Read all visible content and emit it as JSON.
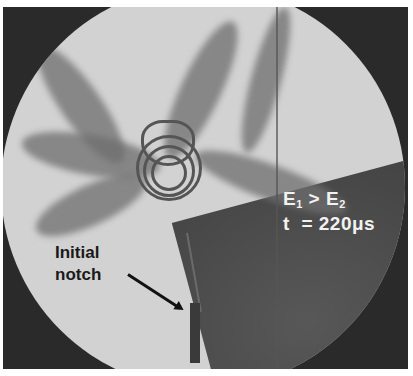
{
  "figure": {
    "annotations": {
      "condition_line": {
        "E": "E",
        "sub1": "1",
        "op": " > ",
        "sub2": "2"
      },
      "time_label": "t  = 220μs",
      "notch_label_line1": "Initial",
      "notch_label_line2": "notch"
    },
    "colors": {
      "background": "#2a2a2a",
      "specimen_light": "#d2d2d2",
      "fringe_dark": "#555555",
      "label_white": "#f2f2f2",
      "label_dark": "#1a1a1a"
    }
  }
}
